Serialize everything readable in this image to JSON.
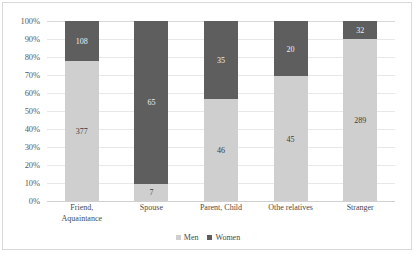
{
  "chart_data": {
    "type": "bar",
    "subtype": "100%-stacked-column",
    "title": "",
    "xlabel": "",
    "ylabel": "",
    "ylim": [
      0,
      100
    ],
    "y_tick_labels": [
      "100%",
      "90%",
      "80%",
      "70%",
      "60%",
      "50%",
      "40%",
      "30%",
      "20%",
      "10%",
      "0%"
    ],
    "y_tick_values": [
      100,
      90,
      80,
      70,
      60,
      50,
      40,
      30,
      20,
      10,
      0
    ],
    "grid": true,
    "legend_position": "bottom",
    "categories": [
      "Friend, Aquaintance",
      "Spouse",
      "Parent, Child",
      "Othe relatives",
      "Stranger"
    ],
    "category_lines": [
      [
        "Friend,",
        "Aquaintance"
      ],
      [
        "Spouse"
      ],
      [
        "Parent, Child"
      ],
      [
        "Othe relatives"
      ],
      [
        "Stranger"
      ]
    ],
    "series": [
      {
        "name": "Men",
        "color": "#cfcfcf",
        "values": [
          377,
          7,
          46,
          45,
          289
        ],
        "percents": [
          77.7,
          9.7,
          56.8,
          69.2,
          90.0
        ]
      },
      {
        "name": "Women",
        "color": "#5e5e5e",
        "values": [
          108,
          65,
          35,
          20,
          32
        ],
        "percents": [
          22.3,
          90.3,
          43.2,
          30.8,
          10.0
        ]
      }
    ],
    "totals": [
      485,
      72,
      81,
      65,
      321
    ]
  },
  "legend": {
    "entries": [
      {
        "label": "Men",
        "color": "#cfcfcf"
      },
      {
        "label": "Women",
        "color": "#5e5e5e"
      }
    ]
  },
  "colors": {
    "men": "#cfcfcf",
    "women": "#5e5e5e",
    "gridline": "#e8e8e8",
    "border": "#d9d9d9",
    "background": "#ffffff",
    "tick_text": "#5a5a5a"
  }
}
